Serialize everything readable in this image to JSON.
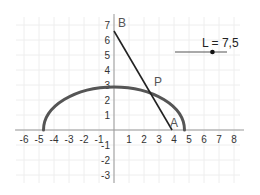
{
  "graph": {
    "origin_px": {
      "x": 114,
      "y": 130
    },
    "unit_px": 15,
    "x_range": [
      -6,
      8
    ],
    "y_range": [
      -3,
      7
    ],
    "x_ticks": [
      "-6",
      "-5",
      "-4",
      "-3",
      "-2",
      "-1",
      "1",
      "2",
      "3",
      "4",
      "5",
      "6",
      "7",
      "8"
    ],
    "x_tick_values": [
      -6,
      -5,
      -4,
      -3,
      -2,
      -1,
      1,
      2,
      3,
      4,
      5,
      6,
      7,
      8
    ],
    "y_ticks": [
      "-3",
      "-2",
      "-1",
      "1",
      "2",
      "3",
      "4",
      "5",
      "6",
      "7"
    ],
    "y_tick_values": [
      -3,
      -2,
      -1,
      1,
      2,
      3,
      4,
      5,
      6,
      7
    ],
    "grid": true,
    "colors": {
      "grid": "#eeeeee",
      "axis": "#999999",
      "curve": "#555555",
      "segment": "#222222",
      "slider": "#555555"
    }
  },
  "objects": {
    "locus_curve": {
      "type": "half-ellipse",
      "center": [
        0,
        0
      ],
      "rx": 4.7,
      "ry": 2.87
    },
    "segment_AB": {
      "from": "B",
      "to": "A"
    },
    "points": {
      "A": {
        "label": "A",
        "x": 3.87,
        "y": 0
      },
      "B": {
        "label": "B",
        "x": 0,
        "y": 6.6
      },
      "P": {
        "label": "P",
        "x": 2.47,
        "y": 2.73
      }
    }
  },
  "slider": {
    "label": "L = 7,5",
    "name": "L",
    "value": 7.5,
    "knob_fraction": 0.72
  }
}
